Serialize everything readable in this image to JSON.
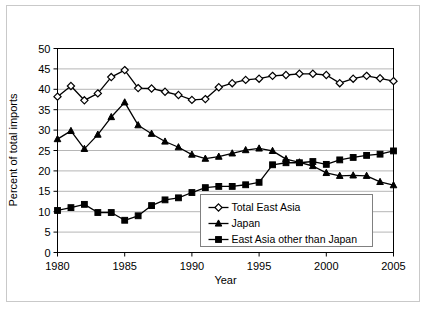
{
  "chart_data": {
    "type": "line",
    "title": "",
    "xlabel": "Year",
    "ylabel": "Percent of total imports",
    "xlim": [
      1980,
      2005
    ],
    "ylim": [
      0,
      50
    ],
    "xticks": [
      1980,
      1985,
      1990,
      1995,
      2000,
      2005
    ],
    "yticks": [
      0,
      5,
      10,
      15,
      20,
      25,
      30,
      35,
      40,
      45,
      50
    ],
    "grid": true,
    "legend_position": "lower-right-inside",
    "x": [
      1980,
      1981,
      1982,
      1983,
      1984,
      1985,
      1986,
      1987,
      1988,
      1989,
      1990,
      1991,
      1992,
      1993,
      1994,
      1995,
      1996,
      1997,
      1998,
      1999,
      2000,
      2001,
      2002,
      2003,
      2004,
      2005
    ],
    "series": [
      {
        "name": "Total East Asia",
        "marker": "open-diamond",
        "color": "#000000",
        "values": [
          38.2,
          40.8,
          37.3,
          39.0,
          43.0,
          44.7,
          40.3,
          40.2,
          39.4,
          38.6,
          37.4,
          37.6,
          40.5,
          41.5,
          42.3,
          42.6,
          43.3,
          43.5,
          43.8,
          43.8,
          43.5,
          41.5,
          42.6,
          43.3,
          42.7,
          42.0
        ]
      },
      {
        "name": "Japan",
        "marker": "filled-triangle",
        "color": "#000000",
        "values": [
          27.8,
          29.8,
          25.4,
          28.9,
          33.2,
          36.8,
          31.2,
          29.1,
          27.2,
          25.8,
          24.0,
          23.0,
          23.5,
          24.3,
          25.1,
          25.5,
          24.9,
          22.9,
          22.1,
          21.2,
          19.5,
          18.8,
          18.9,
          18.8,
          17.3,
          16.5
        ]
      },
      {
        "name": "East Asia other than Japan",
        "marker": "filled-square",
        "color": "#000000",
        "values": [
          10.3,
          11.0,
          11.8,
          9.8,
          9.8,
          7.9,
          9.0,
          11.5,
          12.9,
          13.4,
          14.7,
          15.9,
          16.2,
          16.2,
          16.6,
          17.2,
          21.5,
          22.0,
          22.0,
          22.3,
          21.6,
          22.7,
          23.3,
          23.8,
          24.1,
          24.9
        ]
      }
    ]
  },
  "axis": {
    "y_label": "Percent of total imports",
    "x_label": "Year",
    "y_tick_labels": [
      "0",
      "5",
      "10",
      "15",
      "20",
      "25",
      "30",
      "35",
      "40",
      "45",
      "50"
    ],
    "x_tick_labels": [
      "1980",
      "1985",
      "1990",
      "1995",
      "2000",
      "2005"
    ]
  },
  "legend": {
    "items": [
      {
        "label": "Total East Asia"
      },
      {
        "label": "Japan"
      },
      {
        "label": "East Asia other than Japan"
      }
    ]
  },
  "colors": {
    "line": "#000000",
    "grid": "#b6b6b6",
    "axis": "#000000",
    "frame": "#c9c9c9",
    "background": "#ffffff"
  }
}
